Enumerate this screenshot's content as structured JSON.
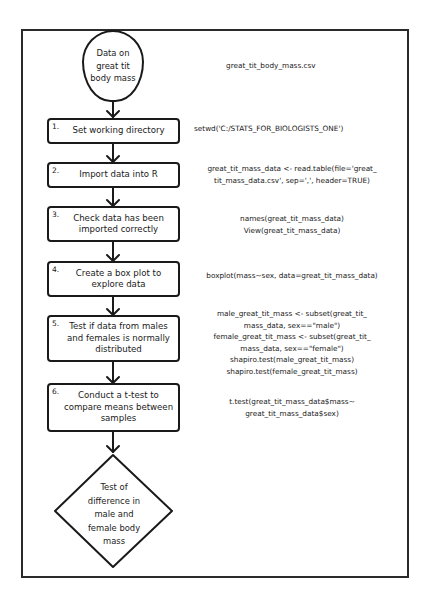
{
  "diagram": {
    "type": "flowchart",
    "start": {
      "label": "Data on great tit body mass",
      "lines": [
        "Data on",
        "great tit",
        "body mass"
      ]
    },
    "start_code": [
      "great_tit_body_mass.csv"
    ],
    "steps": [
      {
        "number": "1.",
        "label": "Set working directory",
        "code": [
          "setwd('C:/STATS_FOR_BIOLOGISTS_ONE')"
        ]
      },
      {
        "number": "2.",
        "label": "Import data into R",
        "code": [
          "great_tit_mass_data <- read.table(file='great_",
          "tit_mass_data.csv', sep=',', header=TRUE)"
        ]
      },
      {
        "number": "3.",
        "label": "Check data has been imported correctly",
        "code": [
          "names(great_tit_mass_data)",
          "View(great_tit_mass_data)"
        ]
      },
      {
        "number": "4.",
        "label": "Create a box plot to explore data",
        "code": [
          "boxplot(mass~sex, data=great_tit_mass_data)"
        ]
      },
      {
        "number": "5.",
        "label": "Test if data from males and females is normally distributed",
        "code": [
          "male_great_tit_mass <- subset(great_tit_",
          "mass_data, sex==\"male\")",
          "female_great_tit_mass <- subset(great_tit_",
          "mass_data, sex==\"female\")",
          "shapiro.test(male_great_tit_mass)",
          "shapiro.test(female_great_tit_mass)"
        ]
      },
      {
        "number": "6.",
        "label": "Conduct a t-test to compare means between samples",
        "code": [
          "t.test(great_tit_mass_data$mass~",
          "great_tit_mass_data$sex)"
        ]
      }
    ],
    "end": {
      "label": "Test of difference in male and female body mass",
      "lines": [
        "Test of",
        "difference in",
        "male and",
        "female body",
        "mass"
      ]
    },
    "colors": {
      "stroke": "#1a1a1a",
      "background": "#ffffff",
      "frame": "#2a2a2a"
    }
  }
}
